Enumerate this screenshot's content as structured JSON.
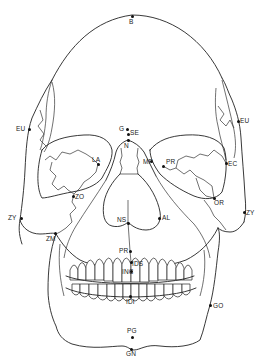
{
  "diagram": {
    "type": "anatomical-diagram",
    "landmarks": [
      {
        "id": "B",
        "label": "B",
        "x": 132,
        "y": 16,
        "lx": 129,
        "ly": 19
      },
      {
        "id": "EU_L",
        "label": "EU",
        "x": 29,
        "y": 129,
        "lx": 16,
        "ly": 126
      },
      {
        "id": "EU_R",
        "label": "EU",
        "x": 238,
        "y": 121,
        "lx": 240,
        "ly": 118
      },
      {
        "id": "G",
        "label": "G",
        "x": 127,
        "y": 129,
        "lx": 119,
        "ly": 126
      },
      {
        "id": "SE",
        "label": "SE",
        "x": 128,
        "y": 134,
        "lx": 130,
        "ly": 130
      },
      {
        "id": "N",
        "label": "N",
        "x": 128,
        "y": 140,
        "lx": 124,
        "ly": 143
      },
      {
        "id": "LA",
        "label": "LA",
        "x": 98,
        "y": 164,
        "lx": 92,
        "ly": 157
      },
      {
        "id": "MF",
        "label": "MF",
        "x": 151,
        "y": 161,
        "lx": 143,
        "ly": 159
      },
      {
        "id": "PR_orb",
        "label": "PR",
        "x": 163,
        "y": 166,
        "lx": 166,
        "ly": 159
      },
      {
        "id": "EC",
        "label": "EC",
        "x": 226,
        "y": 163,
        "lx": 228,
        "ly": 161
      },
      {
        "id": "OR",
        "label": "OR",
        "x": 214,
        "y": 198,
        "lx": 214,
        "ly": 200
      },
      {
        "id": "ZO",
        "label": "ZO",
        "x": 73,
        "y": 196,
        "lx": 75,
        "ly": 194
      },
      {
        "id": "ZY_L",
        "label": "ZY",
        "x": 21,
        "y": 218,
        "lx": 8,
        "ly": 215
      },
      {
        "id": "ZY_R",
        "label": "ZY",
        "x": 244,
        "y": 212,
        "lx": 246,
        "ly": 210
      },
      {
        "id": "ZM",
        "label": "ZM",
        "x": 55,
        "y": 233,
        "lx": 46,
        "ly": 236
      },
      {
        "id": "NS",
        "label": "NS",
        "x": 128,
        "y": 223,
        "lx": 117,
        "ly": 217
      },
      {
        "id": "AL",
        "label": "AL",
        "x": 159,
        "y": 218,
        "lx": 162,
        "ly": 215
      },
      {
        "id": "PR",
        "label": "PR",
        "x": 130,
        "y": 251,
        "lx": 119,
        "ly": 248
      },
      {
        "id": "IDS",
        "label": "IDS",
        "x": 131,
        "y": 262,
        "lx": 132,
        "ly": 261
      },
      {
        "id": "INC",
        "label": "INC",
        "x": 131,
        "y": 271,
        "lx": 122,
        "ly": 269
      },
      {
        "id": "IDI",
        "label": "IDI",
        "x": 130,
        "y": 296,
        "lx": 126,
        "ly": 299
      },
      {
        "id": "GO",
        "label": "GO",
        "x": 210,
        "y": 305,
        "lx": 213,
        "ly": 303
      },
      {
        "id": "PG",
        "label": "PG",
        "x": 132,
        "y": 337,
        "lx": 127,
        "ly": 328
      },
      {
        "id": "GN",
        "label": "GN",
        "x": 131,
        "y": 349,
        "lx": 126,
        "ly": 351
      }
    ]
  }
}
